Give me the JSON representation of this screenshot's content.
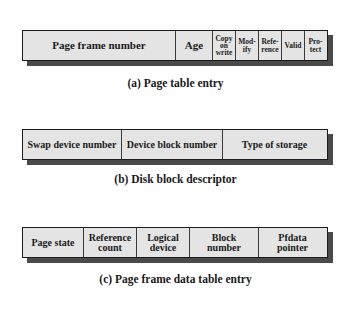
{
  "diagram": {
    "page_table_entry": {
      "caption": "(a) Page table entry",
      "fields": [
        {
          "label": "Page frame number",
          "width": 153
        },
        {
          "label": "Age",
          "width": 37
        },
        {
          "label": "Copy\non\nwrite",
          "width": 23
        },
        {
          "label": "Mod-\nify",
          "width": 23
        },
        {
          "label": "Refe-\nrence",
          "width": 23
        },
        {
          "label": "Valid",
          "width": 23
        },
        {
          "label": "Pro-\ntect",
          "width": 24
        }
      ]
    },
    "disk_block_descriptor": {
      "caption": "(b) Disk block descriptor",
      "fields": [
        {
          "label": "Swap device number",
          "width": 99
        },
        {
          "label": "Device block number",
          "width": 101
        },
        {
          "label": "Type of storage",
          "width": 106
        }
      ]
    },
    "page_frame_data_table_entry": {
      "caption": "(c) Page frame data table entry",
      "fields": [
        {
          "label": "Page state",
          "width": 61
        },
        {
          "label": "Reference\ncount",
          "width": 53
        },
        {
          "label": "Logical\ndevice",
          "width": 53
        },
        {
          "label": "Block\nnumber",
          "width": 69
        },
        {
          "label": "Pfdata\npointer",
          "width": 70
        }
      ]
    }
  },
  "colors": {
    "field_fill": "#e4e4e4",
    "border": "#1c1c1c",
    "shadow": "#4a4a4a",
    "text": "#1a1a1a"
  }
}
